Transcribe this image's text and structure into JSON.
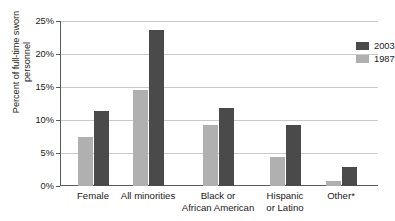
{
  "chart_data": {
    "type": "bar",
    "title": "",
    "subtitle": "",
    "xlabel": "",
    "ylabel": "Percent of full-time sworn personnel",
    "ylabel_lines": [
      "Percent of full-time sworn",
      "personnel"
    ],
    "ylim": [
      0,
      25
    ],
    "ytick_values": [
      0,
      5,
      10,
      15,
      20,
      25
    ],
    "ytick_labels": [
      "0%",
      "5%",
      "10%",
      "15%",
      "20%",
      "25%"
    ],
    "grid": true,
    "grid_axis": "y",
    "legend_position": "top-right",
    "categories": [
      "Female",
      "All minorities",
      "Black or African American",
      "Hispanic or Latino",
      "Other*"
    ],
    "category_label_lines": [
      [
        "Female"
      ],
      [
        "All minorities"
      ],
      [
        "Black or",
        "African American"
      ],
      [
        "Hispanic",
        "or Latino"
      ],
      [
        "Other*"
      ]
    ],
    "series": [
      {
        "name": "2003",
        "color": "#4a4a4a",
        "values": [
          11.3,
          23.7,
          11.8,
          9.3,
          2.9
        ]
      },
      {
        "name": "1987",
        "color": "#b0b0b0",
        "values": [
          7.5,
          14.6,
          9.2,
          4.4,
          0.8
        ]
      }
    ],
    "annotations": []
  },
  "legend": {
    "entries": [
      {
        "label": "2003",
        "color": "#4a4a4a"
      },
      {
        "label": "1987",
        "color": "#b0b0b0"
      }
    ]
  },
  "colors": {
    "series_2003": "#4a4a4a",
    "series_1987": "#b0b0b0",
    "gridline": "#c9c9c9",
    "axis": "#5a5a5a",
    "background": "#ffffff",
    "text": "#1a1a1a"
  }
}
